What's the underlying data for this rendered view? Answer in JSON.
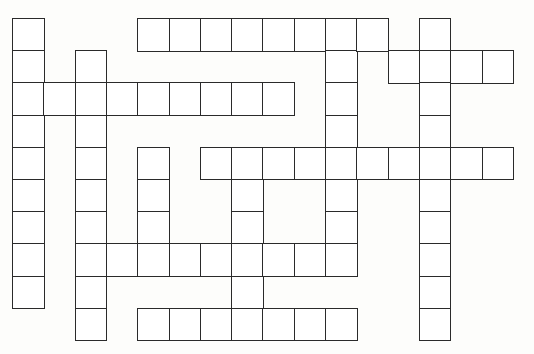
{
  "puzzle": {
    "type": "crossword-blank-grid",
    "origin": {
      "x": 12,
      "y": 18
    },
    "cell_w": 31.3,
    "cell_h": 32.2,
    "line_color": "#2a2a2a",
    "background": "#fdfdfb",
    "entries": [
      {
        "id": "down-col0",
        "dir": "down",
        "col": 0,
        "row": 0,
        "len": 9
      },
      {
        "id": "down-col2",
        "dir": "down",
        "col": 2,
        "row": 1,
        "len": 9
      },
      {
        "id": "down-col4",
        "dir": "down",
        "col": 4,
        "row": 4,
        "len": 4
      },
      {
        "id": "down-col7",
        "dir": "down",
        "col": 7,
        "row": 4,
        "len": 6
      },
      {
        "id": "down-col10",
        "dir": "down",
        "col": 10,
        "row": 0,
        "len": 8
      },
      {
        "id": "down-col13",
        "dir": "down",
        "col": 13,
        "row": 0,
        "len": 10
      },
      {
        "id": "across-row0",
        "dir": "across",
        "col": 4,
        "row": 0,
        "len": 8
      },
      {
        "id": "across-row1",
        "dir": "across",
        "col": 12,
        "row": 1,
        "len": 4
      },
      {
        "id": "across-row2",
        "dir": "across",
        "col": 0,
        "row": 2,
        "len": 9
      },
      {
        "id": "across-row4",
        "dir": "across",
        "col": 6,
        "row": 4,
        "len": 10
      },
      {
        "id": "across-row7",
        "dir": "across",
        "col": 2,
        "row": 7,
        "len": 9
      },
      {
        "id": "across-row9",
        "dir": "across",
        "col": 4,
        "row": 9,
        "len": 7
      }
    ]
  }
}
